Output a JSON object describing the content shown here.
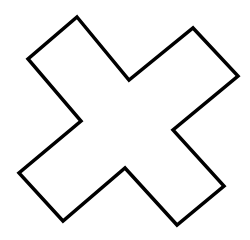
{
  "figure": {
    "shape": "x-cross-outline",
    "colors": {
      "background": "#ffffff",
      "stroke": "#000000",
      "fill": "#ffffff"
    },
    "stroke_width": 3.5,
    "points": "77,17 129,80 193,28 238,76 173,130 224,186 177,225 125,168 63,221 19,173 81,121 28,59"
  }
}
